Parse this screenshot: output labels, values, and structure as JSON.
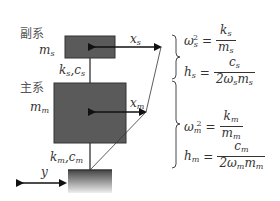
{
  "diagram": {
    "secondary_system": {
      "title": "副系",
      "mass_label": "m",
      "mass_sub": "s",
      "spring_damper_label": "k",
      "spring_damper_sub1": "s",
      "spring_damper_c": "c",
      "spring_damper_sub2": "s",
      "displacement_label": "x",
      "displacement_sub": "s"
    },
    "primary_system": {
      "title": "主系",
      "mass_label": "m",
      "mass_sub": "m",
      "spring_damper_label": "k",
      "spring_damper_sub1": "m",
      "spring_damper_c": "c",
      "spring_damper_sub2": "m",
      "displacement_label": "x",
      "displacement_sub": "m"
    },
    "ground": {
      "displacement_label": "y"
    },
    "equations": {
      "secondary": {
        "omega_lhs": "ω",
        "omega_sub": "s",
        "omega_sup": "2",
        "omega_num": "k",
        "omega_num_sub": "s",
        "omega_den": "m",
        "omega_den_sub": "s",
        "h_lhs": "h",
        "h_sub": "s",
        "h_num": "c",
        "h_num_sub": "s",
        "h_den": "2ω",
        "h_den_sub1": "s",
        "h_den_m": "m",
        "h_den_sub2": "s"
      },
      "primary": {
        "omega_lhs": "ω",
        "omega_sub": "m",
        "omega_sup": "2",
        "omega_num": "k",
        "omega_num_sub": "m",
        "omega_den": "m",
        "omega_den_sub": "m",
        "h_lhs": "h",
        "h_sub": "m",
        "h_num": "c",
        "h_num_sub": "m",
        "h_den": "2ω",
        "h_den_sub1": "m",
        "h_den_m": "m",
        "h_den_sub2": "m"
      },
      "equals": "="
    },
    "colors": {
      "mass_fill": "#5a5a5a",
      "mass_stroke": "#333333",
      "line": "#222222",
      "ground_top": "#4a4a4a",
      "ground_bottom": "#e8e8e8"
    }
  }
}
